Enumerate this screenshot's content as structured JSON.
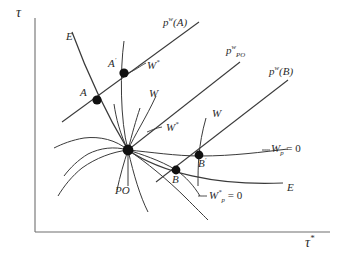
{
  "figure": {
    "type": "economic-diagram",
    "background": "#ffffff",
    "ink": "#2b2b2b",
    "axes": {
      "y_label": "τ",
      "x_label_base": "τ",
      "x_label_sup": "*",
      "origin": [
        35,
        232
      ],
      "x_end": [
        330,
        232
      ],
      "y_end": [
        35,
        18
      ]
    },
    "points": [
      {
        "id": "A",
        "label": "A",
        "label_sup": "",
        "x": 97,
        "y": 100,
        "label_x": 80,
        "label_y": 87
      },
      {
        "id": "Ap",
        "label": "A",
        "label_sup": "′",
        "x": 124,
        "y": 73,
        "label_x": 108,
        "label_y": 58
      },
      {
        "id": "PO",
        "label": "",
        "label_sup": "",
        "x": 128,
        "y": 150,
        "label_x": 0,
        "label_y": 0
      },
      {
        "id": "B",
        "label": "B",
        "label_sup": "",
        "x": 176,
        "y": 170,
        "label_x": 172,
        "label_y": 174
      },
      {
        "id": "Bp",
        "label": "B",
        "label_sup": "′",
        "x": 199,
        "y": 155,
        "label_x": 198,
        "label_y": 158
      }
    ],
    "labels": {
      "pw_A": {
        "base": "p",
        "sup": "w",
        "arg": "(A)",
        "x": 163,
        "y": 17
      },
      "pw_PO": {
        "base": "p",
        "sup": "w",
        "sub": "PO",
        "x": 226,
        "y": 45
      },
      "pw_B": {
        "base": "p",
        "sup": "w",
        "arg": "(B)",
        "x": 269,
        "y": 66
      },
      "E_upper": {
        "text": "E",
        "x": 66,
        "y": 31
      },
      "E_lower": {
        "text": "E",
        "x": 287,
        "y": 182
      },
      "W_star_A": {
        "base": "W",
        "sup": "*",
        "x": 147,
        "y": 60
      },
      "W_mid": {
        "base": "W",
        "sup": "",
        "x": 149,
        "y": 88
      },
      "W_star_mid": {
        "base": "W",
        "sup": "*",
        "x": 166,
        "y": 128
      },
      "W_B": {
        "base": "W",
        "sup": "",
        "x": 212,
        "y": 113
      },
      "PO": {
        "text": "PO",
        "x": 118,
        "y": 185
      },
      "Wp_zero": {
        "base": "W",
        "sub": "p",
        "eq": " = 0",
        "x": 268,
        "y": 147
      },
      "Wstar_p_zero": {
        "base": "W",
        "sup": "*",
        "sub": "p",
        "eq": " = 0",
        "x": 209,
        "y": 193
      }
    },
    "legend_text": {
      "curve_E_name": "E",
      "curve_W_name": "W",
      "curve_Wstar_name": "W*",
      "curve_PO_name": "PO"
    }
  }
}
